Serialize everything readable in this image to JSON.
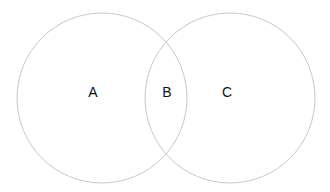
{
  "diagram": {
    "type": "venn",
    "circles": [
      {
        "id": "left",
        "cx": 102,
        "cy": 98,
        "r": 85
      },
      {
        "id": "right",
        "cx": 230,
        "cy": 98,
        "r": 85
      }
    ],
    "stroke_color": "#c8c8c8",
    "labels": [
      {
        "text": "A",
        "region": "left-only",
        "x": 93,
        "y": 97
      },
      {
        "text": "B",
        "region": "intersection",
        "x": 167,
        "y": 97
      },
      {
        "text": "C",
        "region": "right-only",
        "x": 227,
        "y": 97
      }
    ]
  }
}
